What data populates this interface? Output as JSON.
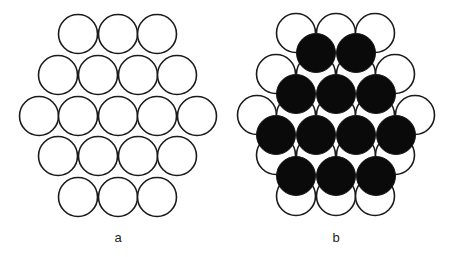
{
  "diagram": {
    "radius": 19.5,
    "stroke_color": "#1a1a1a",
    "fill_open": "#ffffff",
    "fill_filled": "#0a0a0a",
    "panels": [
      {
        "label": "a",
        "label_pos": [
          118,
          242
        ],
        "layers": [
          {
            "style": "open",
            "circles": [
              [
                78,
                34
              ],
              [
                118,
                34
              ],
              [
                157,
                34
              ],
              [
                58,
                75
              ],
              [
                98,
                75
              ],
              [
                138,
                75
              ],
              [
                177,
                75
              ],
              [
                39,
                116
              ],
              [
                78,
                116
              ],
              [
                118,
                116
              ],
              [
                157,
                116
              ],
              [
                197,
                116
              ],
              [
                58,
                156
              ],
              [
                98,
                156
              ],
              [
                138,
                156
              ],
              [
                177,
                156
              ],
              [
                78,
                197
              ],
              [
                118,
                197
              ],
              [
                157,
                197
              ]
            ]
          }
        ]
      },
      {
        "label": "b",
        "label_pos": [
          336,
          242
        ],
        "layers": [
          {
            "style": "open",
            "circles": [
              [
                296,
                33
              ],
              [
                336,
                33
              ],
              [
                375,
                33
              ],
              [
                276,
                74
              ],
              [
                316,
                74
              ],
              [
                356,
                74
              ],
              [
                395,
                74
              ],
              [
                257,
                115
              ],
              [
                296,
                115
              ],
              [
                336,
                115
              ],
              [
                375,
                115
              ],
              [
                415,
                115
              ],
              [
                276,
                155
              ],
              [
                316,
                155
              ],
              [
                356,
                155
              ],
              [
                395,
                155
              ],
              [
                296,
                196
              ],
              [
                336,
                196
              ],
              [
                375,
                196
              ]
            ]
          },
          {
            "style": "filled",
            "circles": [
              [
                316,
                53
              ],
              [
                356,
                53
              ],
              [
                296,
                94
              ],
              [
                336,
                94
              ],
              [
                376,
                94
              ],
              [
                276,
                135
              ],
              [
                316,
                135
              ],
              [
                356,
                135
              ],
              [
                396,
                135
              ],
              [
                296,
                176
              ],
              [
                336,
                176
              ],
              [
                376,
                176
              ]
            ]
          }
        ]
      }
    ]
  }
}
